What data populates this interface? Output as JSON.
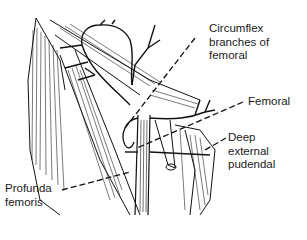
{
  "figure": {
    "ink_color": "#111111",
    "background": "#ffffff"
  },
  "labels": [
    {
      "id": "circumflex",
      "text": "Circumflex\nbranches of\nfemoral"
    },
    {
      "id": "femoral",
      "text": "Femoral"
    },
    {
      "id": "deep-external-pudendal",
      "text": "Deep\nexternal\npudendal"
    },
    {
      "id": "profunda-femoris",
      "text": "Profunda\nfemoris"
    }
  ]
}
